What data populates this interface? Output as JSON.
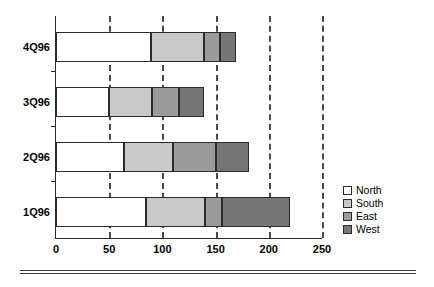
{
  "chart_data": {
    "type": "bar",
    "orientation": "horizontal",
    "stacked": true,
    "title": "",
    "subtitle": "",
    "xlabel": "",
    "ylabel": "",
    "categories": [
      "1Q96",
      "2Q96",
      "3Q96",
      "4Q96"
    ],
    "categories_top_to_bottom": [
      "4Q96",
      "3Q96",
      "2Q96",
      "1Q96"
    ],
    "series": [
      {
        "name": "North",
        "color": "#ffffff",
        "values": [
          85,
          64,
          50,
          89
        ]
      },
      {
        "name": "South",
        "color": "#c9c9c9",
        "values": [
          55,
          46,
          40,
          50
        ]
      },
      {
        "name": "East",
        "color": "#9b9b9b",
        "values": [
          16,
          40,
          26,
          15
        ]
      },
      {
        "name": "West",
        "color": "#767676",
        "values": [
          64,
          31,
          23,
          15
        ]
      }
    ],
    "totals": [
      220,
      181,
      139,
      169
    ],
    "xlim": [
      0,
      250
    ],
    "xticks": [
      0,
      50,
      100,
      150,
      200,
      250
    ],
    "xtick_labels": [
      "0",
      "50",
      "100",
      "150",
      "200",
      "250"
    ],
    "grid": {
      "vertical": true,
      "horizontal": false,
      "style": "dashed",
      "color": "#4a4a4a"
    },
    "legend": {
      "position": "right",
      "entries": [
        "North",
        "South",
        "East",
        "West"
      ]
    }
  },
  "legend": {
    "items": [
      {
        "label": "North",
        "color": "#ffffff"
      },
      {
        "label": "South",
        "color": "#c9c9c9"
      },
      {
        "label": "East",
        "color": "#9b9b9b"
      },
      {
        "label": "West",
        "color": "#767676"
      }
    ]
  },
  "axis": {
    "x_tick_labels": [
      "0",
      "50",
      "100",
      "150",
      "200",
      "250"
    ],
    "y_category_labels": [
      "4Q96",
      "3Q96",
      "2Q96",
      "1Q96"
    ]
  }
}
